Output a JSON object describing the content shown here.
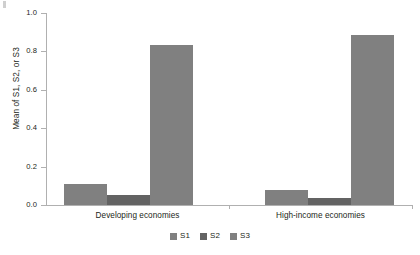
{
  "chart_data": {
    "type": "bar",
    "title": "",
    "subtitle": "",
    "xlabel": "",
    "ylabel": "Mean of S1, S2, or S3",
    "ylim": [
      0.0,
      1.0
    ],
    "yticks": [
      "0.0",
      "0.2",
      "0.4",
      "0.6",
      "0.8",
      "1.0"
    ],
    "ytick_values": [
      0.0,
      0.2,
      0.4,
      0.6,
      0.8,
      1.0
    ],
    "grid": false,
    "legend_position": "bottom-center",
    "categories": [
      "Developing economies",
      "High-income economies"
    ],
    "series": [
      {
        "name": "S1",
        "color": "#808080",
        "values": [
          0.11,
          0.08
        ]
      },
      {
        "name": "S2",
        "color": "#636363",
        "values": [
          0.05,
          0.035
        ]
      },
      {
        "name": "S3",
        "color": "#808080",
        "values": [
          0.835,
          0.885
        ]
      }
    ],
    "annotations": []
  },
  "legend": {
    "items": [
      {
        "label": "S1",
        "color": "#808080"
      },
      {
        "label": "S2",
        "color": "#636363"
      },
      {
        "label": "S3",
        "color": "#808080"
      }
    ]
  },
  "axis": {
    "y_title": "Mean of S1, S2, or S3",
    "y_tick_0": "0.0",
    "y_tick_1": "0.2",
    "y_tick_2": "0.4",
    "y_tick_3": "0.6",
    "y_tick_4": "0.8",
    "y_tick_5": "1.0"
  },
  "groups": {
    "left_label": "Developing economies",
    "right_label": "High-income economies"
  }
}
